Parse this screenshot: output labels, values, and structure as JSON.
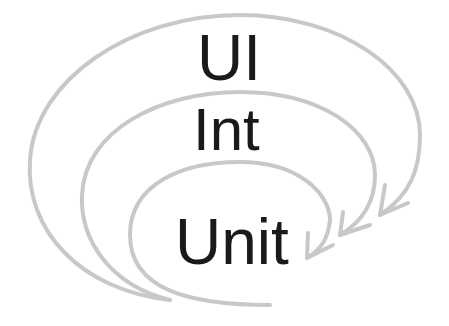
{
  "diagram": {
    "layers": [
      {
        "name": "outer",
        "label": "UI"
      },
      {
        "name": "middle",
        "label": "Int"
      },
      {
        "name": "inner",
        "label": "Unit"
      }
    ],
    "colors": {
      "arrow": "#c8c8c8",
      "text": "#1a1a1a",
      "background": "#ffffff"
    }
  }
}
